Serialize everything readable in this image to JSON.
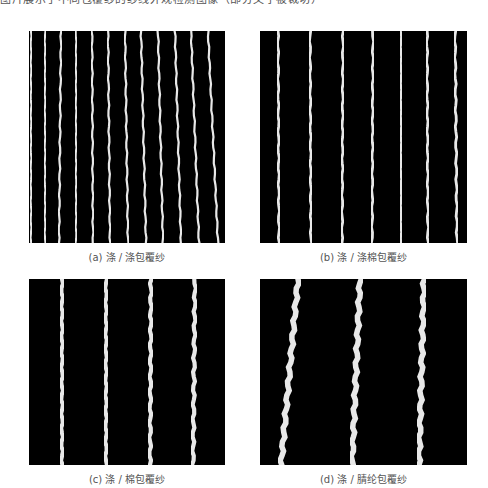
{
  "header": {
    "clipped_text": "图片展示了不同包覆纱的纱线外观检测图像（部分文字被裁切）"
  },
  "panels": [
    {
      "id": "a",
      "caption": "(a) 涤 / 涤包覆纱",
      "box": {
        "x": 29,
        "y": 31,
        "w": 196,
        "h": 212
      },
      "line_width": 2.2,
      "lines": [
        [
          31,
          31
        ],
        [
          45,
          45
        ],
        [
          61,
          59
        ],
        [
          76,
          76
        ],
        [
          92,
          93
        ],
        [
          108,
          110
        ],
        [
          125,
          128
        ],
        [
          141,
          146
        ],
        [
          158,
          163
        ],
        [
          175,
          181
        ],
        [
          191,
          199
        ],
        [
          208,
          218
        ]
      ]
    },
    {
      "id": "b",
      "caption": "(b) 涤 / 涤棉包覆纱",
      "box": {
        "x": 260,
        "y": 31,
        "w": 207,
        "h": 212
      },
      "line_width": 2.8,
      "lines": [
        [
          278,
          279
        ],
        [
          310,
          311
        ],
        [
          343,
          342
        ],
        [
          373,
          372
        ],
        [
          401,
          401
        ],
        [
          427,
          428
        ],
        [
          455,
          457
        ]
      ]
    },
    {
      "id": "c",
      "caption": "(c) 涤 / 棉包覆纱",
      "box": {
        "x": 29,
        "y": 279,
        "w": 196,
        "h": 186
      },
      "line_width": 4.2,
      "lines": [
        [
          62,
          62
        ],
        [
          106,
          106
        ],
        [
          151,
          150
        ],
        [
          195,
          193
        ]
      ]
    },
    {
      "id": "d",
      "caption": "(d) 涤 / 腈纶包覆纱",
      "box": {
        "x": 260,
        "y": 279,
        "w": 207,
        "h": 186
      },
      "line_width": 5.5,
      "lines": [
        [
          298,
          281
        ],
        [
          360,
          352
        ],
        [
          424,
          419
        ]
      ]
    }
  ],
  "colors": {
    "background": "#ffffff",
    "panel": "#000000",
    "yarn": "#e8e8e8",
    "caption": "#555555"
  }
}
